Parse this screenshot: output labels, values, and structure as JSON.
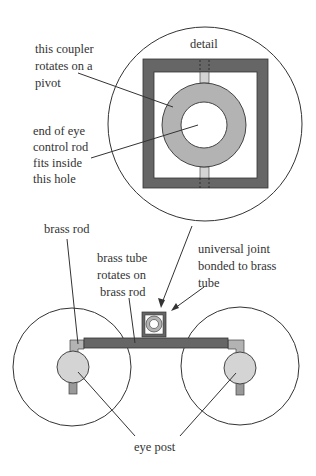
{
  "colors": {
    "frame": "#666666",
    "coupler": "#b3b3b3",
    "light": "#d4d4d4",
    "line": "#333333",
    "background": "#ffffff"
  },
  "detail": {
    "title": "detail",
    "coupler_label": [
      "this coupler",
      "rotates on a",
      "pivot"
    ],
    "hole_label": [
      "end of eye",
      "control rod",
      "fits inside",
      "this hole"
    ]
  },
  "assembly": {
    "brass_rod_label": "brass rod",
    "brass_tube_label": [
      "brass tube",
      "rotates on",
      "brass rod"
    ],
    "universal_joint_label": [
      "universal joint",
      "bonded to brass",
      "tube"
    ],
    "eye_post_label": "eye post"
  }
}
